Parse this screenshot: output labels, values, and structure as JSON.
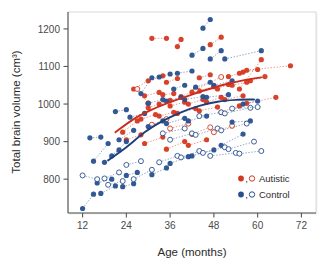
{
  "chart_data": {
    "type": "scatter",
    "title": "",
    "xlabel": "Age (months)",
    "ylabel": "Total brain volume  (cm³)",
    "xlim": [
      8,
      76
    ],
    "ylim": [
      710,
      1245
    ],
    "xticks": [
      12,
      24,
      36,
      48,
      60,
      72
    ],
    "yticks": [
      800,
      900,
      1000,
      1100,
      1200
    ],
    "grid": false,
    "legend_position": "bottom-right",
    "legend": [
      {
        "name": "Autistic",
        "color": "#d6381f",
        "marker": "filled-and-open-circle"
      },
      {
        "name": "Control",
        "color": "#28508f",
        "marker": "filled-and-open-circle"
      }
    ],
    "note": "Longitudinal study: each subject contributes 1-4 repeated measurements connected by dotted lines. Filled markers = males, open markers = females. Solid smoothed curves show group means.",
    "series": [
      {
        "name": "Autistic",
        "color": "#d6381f",
        "subjects": [
          {
            "open": false,
            "x": [
              31,
              35
            ],
            "y": [
              1175,
              1175
            ]
          },
          {
            "open": false,
            "x": [
              38,
              39
            ],
            "y": [
              1153,
              1172
            ]
          },
          {
            "open": false,
            "x": [
              47,
              50
            ],
            "y": [
              1158,
              1178
            ]
          },
          {
            "open": false,
            "x": [
              26,
              30,
              34
            ],
            "y": [
              1040,
              1062,
              1075
            ]
          },
          {
            "open": false,
            "x": [
              35,
              38
            ],
            "y": [
              1058,
              1068
            ]
          },
          {
            "open": false,
            "x": [
              44,
              47
            ],
            "y": [
              1070,
              1078
            ]
          },
          {
            "open": false,
            "x": [
              52,
              55
            ],
            "y": [
              1073,
              1082
            ]
          },
          {
            "open": false,
            "x": [
              56,
              60
            ],
            "y": [
              1085,
              1092
            ]
          },
          {
            "open": false,
            "x": [
              58,
              62
            ],
            "y": [
              1062,
              1073
            ]
          },
          {
            "open": false,
            "x": [
              57,
              69
            ],
            "y": [
              1090,
              1102
            ]
          },
          {
            "open": false,
            "x": [
              55,
              61
            ],
            "y": [
              1040,
              1118
            ]
          },
          {
            "open": false,
            "x": [
              29,
              33
            ],
            "y": [
              1022,
              1031
            ]
          },
          {
            "open": false,
            "x": [
              34,
              37
            ],
            "y": [
              1025,
              1028
            ]
          },
          {
            "open": false,
            "x": [
              39,
              42
            ],
            "y": [
              1020,
              1032
            ]
          },
          {
            "open": false,
            "x": [
              44,
              48
            ],
            "y": [
              1035,
              1046
            ]
          },
          {
            "open": false,
            "x": [
              49,
              52
            ],
            "y": [
              1040,
              1052
            ]
          },
          {
            "open": false,
            "x": [
              53,
              57
            ],
            "y": [
              1050,
              1058
            ]
          },
          {
            "open": false,
            "x": [
              30,
              33,
              36
            ],
            "y": [
              990,
              1000,
              1010
            ]
          },
          {
            "open": false,
            "x": [
              36,
              40
            ],
            "y": [
              995,
              1005
            ]
          },
          {
            "open": false,
            "x": [
              41,
              45
            ],
            "y": [
              1000,
              1012
            ]
          },
          {
            "open": false,
            "x": [
              46,
              50
            ],
            "y": [
              1005,
              1018
            ]
          },
          {
            "open": false,
            "x": [
              51,
              56
            ],
            "y": [
              1012,
              1022
            ]
          },
          {
            "open": false,
            "x": [
              23,
              27
            ],
            "y": [
              925,
              955
            ]
          },
          {
            "open": false,
            "x": [
              28,
              32
            ],
            "y": [
              960,
              972
            ]
          },
          {
            "open": false,
            "x": [
              33,
              37
            ],
            "y": [
              968,
              978
            ]
          },
          {
            "open": false,
            "x": [
              38,
              43
            ],
            "y": [
              975,
              988
            ]
          },
          {
            "open": false,
            "x": [
              44,
              49
            ],
            "y": [
              982,
              992
            ]
          },
          {
            "open": false,
            "x": [
              50,
              55
            ],
            "y": [
              978,
              995
            ]
          },
          {
            "open": false,
            "x": [
              57,
              65
            ],
            "y": [
              1002,
              1018
            ]
          },
          {
            "open": false,
            "x": [
              24,
              28
            ],
            "y": [
              905,
              918
            ]
          },
          {
            "open": false,
            "x": [
              29,
              34
            ],
            "y": [
              895,
              912
            ]
          },
          {
            "open": false,
            "x": [
              35,
              40
            ],
            "y": [
              880,
              900
            ]
          },
          {
            "open": false,
            "x": [
              41,
              46
            ],
            "y": [
              890,
              905
            ]
          },
          {
            "open": true,
            "x": [
              31,
              35
            ],
            "y": [
              945,
              960
            ]
          },
          {
            "open": true,
            "x": [
              36,
              41
            ],
            "y": [
              935,
              948
            ]
          },
          {
            "open": true,
            "x": [
              42,
              47
            ],
            "y": [
              920,
              938
            ]
          },
          {
            "open": true,
            "x": [
              48,
              53
            ],
            "y": [
              925,
              942
            ]
          },
          {
            "open": true,
            "x": [
              43,
              50
            ],
            "y": [
              1038,
              1072
            ]
          },
          {
            "open": true,
            "x": [
              27,
              30
            ],
            "y": [
              1040,
              1002
            ]
          }
        ]
      },
      {
        "name": "Control",
        "color": "#28508f",
        "subjects": [
          {
            "open": false,
            "x": [
              45,
              47
            ],
            "y": [
              1202,
              1225
            ]
          },
          {
            "open": false,
            "x": [
              42,
              45
            ],
            "y": [
              1130,
              1148
            ]
          },
          {
            "open": false,
            "x": [
              47,
              50
            ],
            "y": [
              1120,
              1142
            ]
          },
          {
            "open": false,
            "x": [
              51,
              61
            ],
            "y": [
              1120,
              1142
            ]
          },
          {
            "open": false,
            "x": [
              33,
              36
            ],
            "y": [
              1072,
              1080
            ]
          },
          {
            "open": false,
            "x": [
              38,
              42
            ],
            "y": [
              1082,
              1088
            ]
          },
          {
            "open": false,
            "x": [
              28,
              31
            ],
            "y": [
              1028,
              1070
            ]
          },
          {
            "open": false,
            "x": [
              37,
              40
            ],
            "y": [
              1040,
              1050
            ]
          },
          {
            "open": false,
            "x": [
              43,
              47
            ],
            "y": [
              1045,
              1058
            ]
          },
          {
            "open": false,
            "x": [
              48,
              53
            ],
            "y": [
              1050,
              1062
            ]
          },
          {
            "open": false,
            "x": [
              30,
              34
            ],
            "y": [
              1002,
              1012
            ]
          },
          {
            "open": false,
            "x": [
              35,
              39
            ],
            "y": [
              1008,
              1018
            ]
          },
          {
            "open": false,
            "x": [
              40,
              45
            ],
            "y": [
              1012,
              1020
            ]
          },
          {
            "open": false,
            "x": [
              46,
              52
            ],
            "y": [
              1018,
              1025
            ]
          },
          {
            "open": false,
            "x": [
              56,
              60
            ],
            "y": [
              1000,
              1008
            ]
          },
          {
            "open": false,
            "x": [
              21,
              24
            ],
            "y": [
              980,
              985
            ]
          },
          {
            "open": false,
            "x": [
              25,
              29
            ],
            "y": [
              965,
              975
            ]
          },
          {
            "open": false,
            "x": [
              30,
              34
            ],
            "y": [
              940,
              955
            ]
          },
          {
            "open": false,
            "x": [
              35,
              40
            ],
            "y": [
              948,
              962
            ]
          },
          {
            "open": false,
            "x": [
              41,
              46
            ],
            "y": [
              955,
              968
            ]
          },
          {
            "open": false,
            "x": [
              53,
              58
            ],
            "y": [
              952,
              955
            ]
          },
          {
            "open": false,
            "x": [
              14,
              17
            ],
            "y": [
              910,
              912
            ]
          },
          {
            "open": false,
            "x": [
              15,
              19
            ],
            "y": [
              848,
              895
            ]
          },
          {
            "open": false,
            "x": [
              20,
              24
            ],
            "y": [
              862,
              900
            ]
          },
          {
            "open": false,
            "x": [
              22,
              26
            ],
            "y": [
              905,
              930
            ]
          },
          {
            "open": false,
            "x": [
              18,
              22
            ],
            "y": [
              845,
              878
            ]
          },
          {
            "open": false,
            "x": [
              16,
              20
            ],
            "y": [
              790,
              800
            ]
          },
          {
            "open": false,
            "x": [
              17,
              21
            ],
            "y": [
              762,
              782
            ]
          },
          {
            "open": false,
            "x": [
              24,
              27
            ],
            "y": [
              810,
              818
            ]
          },
          {
            "open": false,
            "x": [
              23,
              26
            ],
            "y": [
              780,
              788
            ]
          },
          {
            "open": false,
            "x": [
              12,
              15
            ],
            "y": [
              722,
              760
            ]
          },
          {
            "open": false,
            "x": [
              31,
              35
            ],
            "y": [
              812,
              830
            ]
          },
          {
            "open": false,
            "x": [
              36,
              41
            ],
            "y": [
              842,
              860
            ]
          },
          {
            "open": false,
            "x": [
              42,
              48
            ],
            "y": [
              862,
              878
            ]
          },
          {
            "open": false,
            "x": [
              50,
              56
            ],
            "y": [
              890,
              920
            ]
          },
          {
            "open": true,
            "x": [
              12,
              16
            ],
            "y": [
              810,
              800
            ]
          },
          {
            "open": true,
            "x": [
              18,
              22
            ],
            "y": [
              802,
              818
            ]
          },
          {
            "open": true,
            "x": [
              19,
              23
            ],
            "y": [
              785,
              795
            ]
          },
          {
            "open": true,
            "x": [
              24,
              28
            ],
            "y": [
              838,
              848
            ]
          },
          {
            "open": true,
            "x": [
              26,
              31
            ],
            "y": [
              800,
              825
            ]
          },
          {
            "open": true,
            "x": [
              33,
              38
            ],
            "y": [
              845,
              862
            ]
          },
          {
            "open": true,
            "x": [
              39,
              44
            ],
            "y": [
              858,
              875
            ]
          },
          {
            "open": true,
            "x": [
              45,
              51
            ],
            "y": [
              870,
              885
            ]
          },
          {
            "open": true,
            "x": [
              52,
              59
            ],
            "y": [
              880,
              900
            ]
          },
          {
            "open": true,
            "x": [
              36,
              42
            ],
            "y": [
              905,
              922
            ]
          },
          {
            "open": true,
            "x": [
              43,
              49
            ],
            "y": [
              918,
              935
            ]
          },
          {
            "open": true,
            "x": [
              50,
              57
            ],
            "y": [
              930,
              948
            ]
          },
          {
            "open": true,
            "x": [
              44,
              50
            ],
            "y": [
              968,
              978
            ]
          },
          {
            "open": true,
            "x": [
              51,
              58
            ],
            "y": [
              975,
              990
            ]
          },
          {
            "open": true,
            "x": [
              53,
              60
            ],
            "y": [
              988,
              992
            ]
          },
          {
            "open": true,
            "x": [
              47,
              54
            ],
            "y": [
              862,
              870
            ]
          },
          {
            "open": true,
            "x": [
              55,
              61
            ],
            "y": [
              868,
              875
            ]
          },
          {
            "open": true,
            "x": [
              34,
              40
            ],
            "y": [
              922,
              935
            ]
          }
        ]
      }
    ],
    "trend_lines": [
      {
        "name": "Autistic mean",
        "color": "#cc2c1c",
        "x": [
          21,
          26,
          31,
          36,
          41,
          46,
          51,
          56,
          61
        ],
        "y": [
          925,
          960,
          985,
          1005,
          1022,
          1038,
          1052,
          1063,
          1071
        ]
      },
      {
        "name": "Control mean",
        "color": "#1f3f7a",
        "x": [
          19,
          24,
          29,
          34,
          39,
          44,
          49,
          54,
          59
        ],
        "y": [
          850,
          885,
          925,
          955,
          978,
          995,
          1006,
          1011,
          1012
        ]
      }
    ]
  }
}
